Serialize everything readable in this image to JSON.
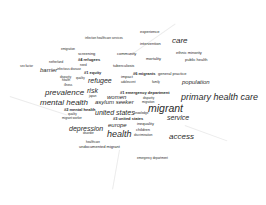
{
  "wordcloud": {
    "background": "#ffffff",
    "text_color": "#2a2a2a",
    "words": [
      {
        "text": "experience",
        "x": 140,
        "y": 30,
        "size": "s2"
      },
      {
        "text": "intervention",
        "x": 140,
        "y": 42,
        "size": "s2"
      },
      {
        "text": "care",
        "x": 172,
        "y": 37,
        "size": "s6"
      },
      {
        "text": "infection",
        "x": 85,
        "y": 37,
        "size": "s1"
      },
      {
        "text": "healthcare services",
        "x": 97,
        "y": 37,
        "size": "s1"
      },
      {
        "text": "ethnic minority",
        "x": 176,
        "y": 51,
        "size": "s2"
      },
      {
        "text": "emigration",
        "x": 61,
        "y": 48,
        "size": "s1"
      },
      {
        "text": "screening",
        "x": 78,
        "y": 52,
        "size": "s2"
      },
      {
        "text": "community",
        "x": 117,
        "y": 52,
        "size": "s2"
      },
      {
        "text": "mortality",
        "x": 146,
        "y": 57,
        "size": "s2"
      },
      {
        "text": "public health",
        "x": 185,
        "y": 58,
        "size": "s2"
      },
      {
        "text": "#4 refugees",
        "x": 78,
        "y": 58,
        "size": "s2",
        "bold": true
      },
      {
        "text": "netherland",
        "x": 49,
        "y": 61,
        "size": "s1"
      },
      {
        "text": "need",
        "x": 80,
        "y": 64,
        "size": "s1"
      },
      {
        "text": "tuberculosis",
        "x": 113,
        "y": 64,
        "size": "s2"
      },
      {
        "text": "sex factor",
        "x": 20,
        "y": 65,
        "size": "s1"
      },
      {
        "text": "barrier",
        "x": 40,
        "y": 67,
        "size": "s4"
      },
      {
        "text": "infectious disease",
        "x": 57,
        "y": 68,
        "size": "s1"
      },
      {
        "text": "#1 equity",
        "x": 84,
        "y": 71,
        "size": "s2",
        "bold": true
      },
      {
        "text": "#6 migrants",
        "x": 133,
        "y": 72,
        "size": "s2",
        "bold": true
      },
      {
        "text": "general practice",
        "x": 158,
        "y": 72,
        "size": "s2"
      },
      {
        "text": "disparity",
        "x": 60,
        "y": 76,
        "size": "s1"
      },
      {
        "text": "health",
        "x": 62,
        "y": 79,
        "size": "s1"
      },
      {
        "text": "quality",
        "x": 76,
        "y": 77,
        "size": "s1"
      },
      {
        "text": "refugee",
        "x": 88,
        "y": 77,
        "size": "s5"
      },
      {
        "text": "impact",
        "x": 121,
        "y": 75,
        "size": "s2"
      },
      {
        "text": "population",
        "x": 182,
        "y": 79,
        "size": "s4"
      },
      {
        "text": "adolescent",
        "x": 121,
        "y": 81,
        "size": "s1"
      },
      {
        "text": "family",
        "x": 152,
        "y": 81,
        "size": "s1"
      },
      {
        "text": "illness",
        "x": 64,
        "y": 84,
        "size": "s1"
      },
      {
        "text": "risk",
        "x": 87,
        "y": 87,
        "size": "s5"
      },
      {
        "text": "#1 emergency department",
        "x": 120,
        "y": 91,
        "size": "s2",
        "bold": true
      },
      {
        "text": "prevalence",
        "x": 45,
        "y": 89,
        "size": "s6"
      },
      {
        "text": "women",
        "x": 107,
        "y": 94,
        "size": "s4"
      },
      {
        "text": "japan",
        "x": 89,
        "y": 95,
        "size": "s1"
      },
      {
        "text": "primary health care",
        "x": 181,
        "y": 93,
        "size": "s7"
      },
      {
        "text": "mental health",
        "x": 40,
        "y": 99,
        "size": "s6"
      },
      {
        "text": "asylum seeker",
        "x": 95,
        "y": 99,
        "size": "s4"
      },
      {
        "text": "disparity",
        "x": 143,
        "y": 97,
        "size": "s1"
      },
      {
        "text": "migration",
        "x": 142,
        "y": 101,
        "size": "s1"
      },
      {
        "text": "migrant",
        "x": 148,
        "y": 103,
        "size": "s8"
      },
      {
        "text": "#2 mental health",
        "x": 64,
        "y": 108,
        "size": "s2",
        "bold": true
      },
      {
        "text": "united states",
        "x": 95,
        "y": 109,
        "size": "s5"
      },
      {
        "text": "quality",
        "x": 68,
        "y": 113,
        "size": "s1"
      },
      {
        "text": "knowledge",
        "x": 134,
        "y": 112,
        "size": "s1"
      },
      {
        "text": "service",
        "x": 167,
        "y": 114,
        "size": "s5"
      },
      {
        "text": "migrant worker",
        "x": 62,
        "y": 117,
        "size": "s1"
      },
      {
        "text": "#3 united states",
        "x": 113,
        "y": 117,
        "size": "s2",
        "bold": true
      },
      {
        "text": "europe",
        "x": 108,
        "y": 122,
        "size": "s4"
      },
      {
        "text": "inequality",
        "x": 137,
        "y": 122,
        "size": "s2"
      },
      {
        "text": "depression",
        "x": 69,
        "y": 125,
        "size": "s5"
      },
      {
        "text": "disorder",
        "x": 83,
        "y": 132,
        "size": "s1"
      },
      {
        "text": "health",
        "x": 107,
        "y": 130,
        "size": "s7"
      },
      {
        "text": "children",
        "x": 136,
        "y": 128,
        "size": "s2"
      },
      {
        "text": "access",
        "x": 169,
        "y": 133,
        "size": "s6"
      },
      {
        "text": "discrimination",
        "x": 134,
        "y": 134,
        "size": "s1"
      },
      {
        "text": "healthcare",
        "x": 86,
        "y": 141,
        "size": "s1"
      },
      {
        "text": "undocumented migrant",
        "x": 79,
        "y": 145,
        "size": "s2"
      },
      {
        "text": "emergency department",
        "x": 137,
        "y": 157,
        "size": "s1"
      }
    ]
  }
}
